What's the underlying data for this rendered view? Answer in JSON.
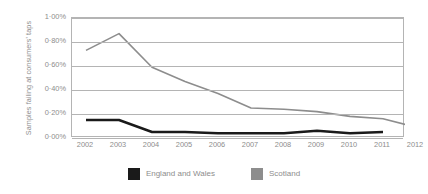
{
  "chart_data": {
    "type": "line",
    "title": "",
    "xlabel": "",
    "ylabel": "Samples failing at consumers' taps",
    "categories": [
      "2002",
      "2003",
      "2004",
      "2005",
      "2006",
      "2007",
      "2008",
      "2009",
      "2010",
      "2011",
      "2012"
    ],
    "x": [
      2002,
      2003,
      2004,
      2005,
      2006,
      2007,
      2008,
      2009,
      2010,
      2011,
      2012
    ],
    "ylim": [
      0,
      1.0
    ],
    "y_ticks": [
      0,
      0.2,
      0.4,
      0.6,
      0.8,
      1.0
    ],
    "y_tick_labels": [
      "0·00%",
      "0·20%",
      "0·40%",
      "0·60%",
      "0·80%",
      "1·00%"
    ],
    "grid": "horizontal",
    "legend_position": "bottom-center",
    "series": [
      {
        "name": "England and Wales",
        "color": "#1a1a1a",
        "values": [
          0.15,
          0.15,
          0.05,
          0.05,
          0.04,
          0.04,
          0.04,
          0.06,
          0.04,
          0.05,
          null
        ]
      },
      {
        "name": "Scotland",
        "color": "#8d8d8d",
        "values": [
          0.73,
          0.87,
          0.59,
          0.47,
          0.37,
          0.25,
          0.24,
          0.22,
          0.18,
          0.16,
          0.09
        ]
      }
    ]
  },
  "axis": {
    "y_title": "Samples failing at consumers' taps",
    "y_labels": [
      "1·00%",
      "0·80%",
      "0·60%",
      "0·40%",
      "0·20%",
      "0·00%"
    ],
    "x_labels": [
      "2002",
      "2003",
      "2004",
      "2005",
      "2006",
      "2007",
      "2008",
      "2009",
      "2010",
      "2011",
      "2012"
    ]
  },
  "legend": {
    "entries": [
      {
        "label": "England and Wales",
        "color": "#1a1a1a"
      },
      {
        "label": "Scotland",
        "color": "#8d8d8d"
      }
    ]
  },
  "colors": {
    "grid": "#b4b4b4",
    "text": "#8d8d8d",
    "england_and_wales": "#1a1a1a",
    "scotland": "#8d8d8d",
    "background": "#ffffff"
  }
}
